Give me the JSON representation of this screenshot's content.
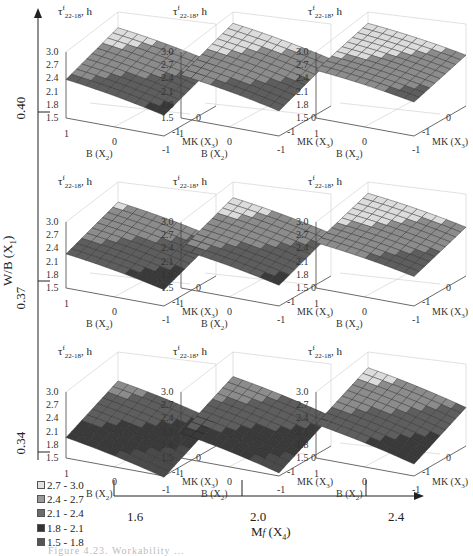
{
  "chart_data": {
    "type": "surface-grid",
    "title": "",
    "zlabel": "τ^f 22-18, h",
    "panel_xlabel": "B (X2)",
    "panel_ylabel": "MK (X3)",
    "z_ticks": [
      "3.0",
      "2.7",
      "2.4",
      "2.1",
      "1.8",
      "1.5"
    ],
    "x_ticks": [
      "1",
      "0",
      "-1"
    ],
    "y_ticks": [
      "-1",
      "0",
      "1"
    ],
    "outer_y_axis": {
      "label": "W/B (X1)",
      "ticks": [
        "0.40",
        "0.37",
        "0.34"
      ]
    },
    "outer_x_axis": {
      "label": "Mf (X4)",
      "ticks": [
        "1.6",
        "2.0",
        "2.4"
      ]
    },
    "legend": [
      {
        "label": "2.7 - 3.0",
        "color": "#e0e0e0"
      },
      {
        "label": "2.4 - 2.7",
        "color": "#9a9a9a"
      },
      {
        "label": "2.1 - 2.4",
        "color": "#6e6e6e"
      },
      {
        "label": "1.8 - 2.1",
        "color": "#3a3a3a"
      },
      {
        "label": "1.5 - 1.8",
        "color": "#555555"
      }
    ],
    "panels": [
      {
        "row": "0.40",
        "col": "1.6",
        "z_range": [
          2.0,
          2.9
        ]
      },
      {
        "row": "0.40",
        "col": "2.0",
        "z_range": [
          2.1,
          3.0
        ]
      },
      {
        "row": "0.40",
        "col": "2.4",
        "z_range": [
          2.3,
          3.0
        ]
      },
      {
        "row": "0.37",
        "col": "1.6",
        "z_range": [
          1.9,
          2.8
        ]
      },
      {
        "row": "0.37",
        "col": "2.0",
        "z_range": [
          2.0,
          2.9
        ]
      },
      {
        "row": "0.37",
        "col": "2.4",
        "z_range": [
          2.2,
          3.0
        ]
      },
      {
        "row": "0.34",
        "col": "1.6",
        "z_range": [
          1.5,
          2.6
        ]
      },
      {
        "row": "0.34",
        "col": "2.0",
        "z_range": [
          1.6,
          2.7
        ]
      },
      {
        "row": "0.34",
        "col": "2.4",
        "z_range": [
          1.8,
          2.9
        ]
      }
    ]
  },
  "panel_text": {
    "tau": "τ",
    "sup": "f",
    "sub": "22-18",
    "unit": ", h",
    "b": "B (X",
    "b_sub": "2",
    "mk": "MK (X",
    "mk_sub": "3",
    "close": ")"
  },
  "outer": {
    "y_label": "W/B (X1)",
    "y_ticks": [
      "0.40",
      "0.37",
      "0.34"
    ],
    "x_label_main": "M",
    "x_label_sub": "f",
    "x_label_rest": " (X4)",
    "x_ticks": [
      "1.6",
      "2.0",
      "2.4"
    ]
  },
  "legend": [
    {
      "label": "2.7 - 3.0"
    },
    {
      "label": "2.4 - 2.7"
    },
    {
      "label": "2.1 - 2.4"
    },
    {
      "label": "1.8 - 2.1"
    },
    {
      "label": "1.5 - 1.8"
    }
  ],
  "caption": "Figure 4.23. Workability ..."
}
